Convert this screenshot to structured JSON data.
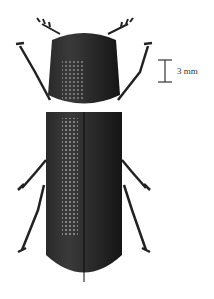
{
  "figure": {
    "scale_bar": {
      "label": "3 mm"
    },
    "colors": {
      "body": "#1a1a1a",
      "highlight": "#8a8a8a",
      "background": "#ffffff",
      "text": "#333333"
    }
  }
}
